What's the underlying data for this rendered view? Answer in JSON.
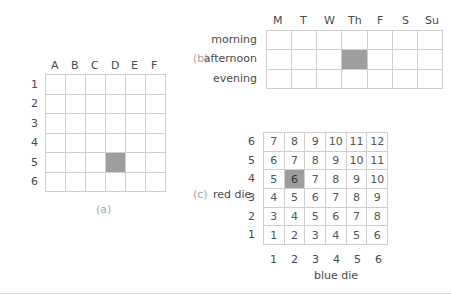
{
  "figure_a": {
    "caption": "(a)",
    "col_labels": [
      "A",
      "B",
      "C",
      "D",
      "E",
      "F"
    ],
    "row_labels": [
      "1",
      "2",
      "3",
      "4",
      "5",
      "6"
    ],
    "highlighted_cell": {
      "row": "5",
      "col": "D"
    }
  },
  "figure_b": {
    "caption": "(b)",
    "col_labels": [
      "M",
      "T",
      "W",
      "Th",
      "F",
      "S",
      "Su"
    ],
    "row_labels": [
      "morning",
      "afternoon",
      "evening"
    ],
    "highlighted_cell": {
      "row": "afternoon",
      "col": "Th"
    }
  },
  "figure_c": {
    "caption": "(c)",
    "y_axis_label": "red die",
    "x_axis_label": "blue die",
    "row_labels": [
      "6",
      "5",
      "4",
      "3",
      "2",
      "1"
    ],
    "col_labels": [
      "1",
      "2",
      "3",
      "4",
      "5",
      "6"
    ],
    "rows": [
      [
        "7",
        "8",
        "9",
        "10",
        "11",
        "12"
      ],
      [
        "6",
        "7",
        "8",
        "9",
        "10",
        "11"
      ],
      [
        "5",
        "6",
        "7",
        "8",
        "9",
        "10"
      ],
      [
        "4",
        "5",
        "6",
        "7",
        "8",
        "9"
      ],
      [
        "3",
        "4",
        "5",
        "6",
        "7",
        "8"
      ],
      [
        "1",
        "2",
        "3",
        "4",
        "5",
        "6"
      ]
    ],
    "highlighted_cell": {
      "red": "4",
      "blue": "2",
      "value": "6"
    }
  },
  "colors": {
    "grid_line": "#cfcfcf",
    "highlight": "#9e9e9e",
    "caption": "#a9a9a9",
    "text": "#4a4a4a"
  }
}
